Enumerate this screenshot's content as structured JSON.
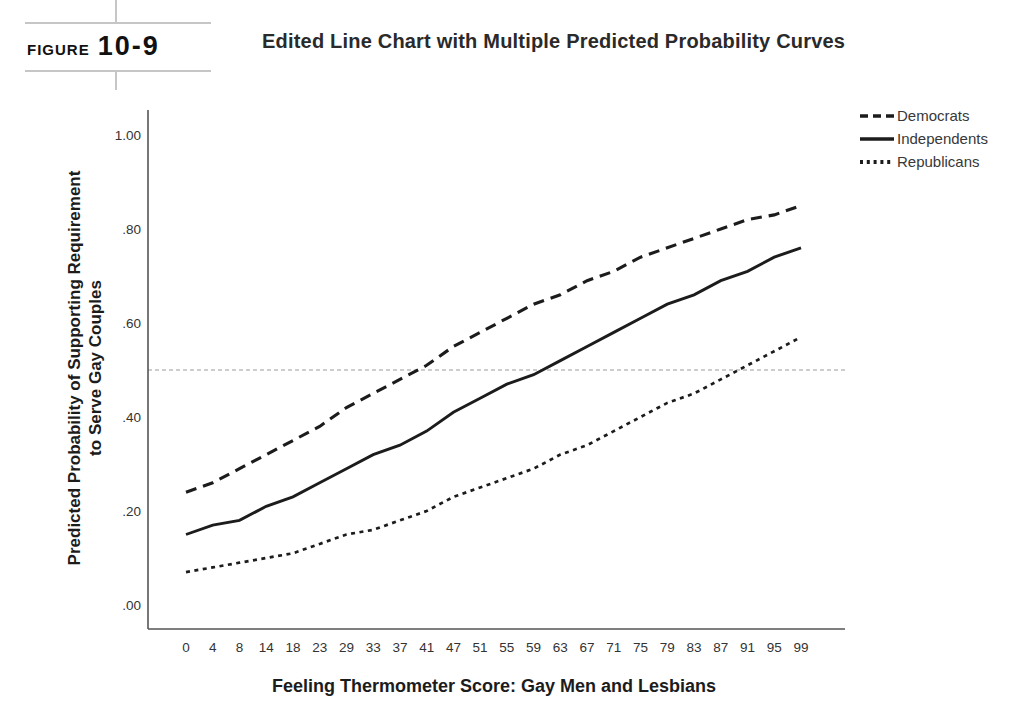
{
  "figure": {
    "label_word": "FIGURE",
    "label_number": "10-9",
    "title": "Edited Line Chart with Multiple Predicted Probability Curves"
  },
  "chart_data": {
    "type": "line",
    "title": "",
    "xlabel": "Feeling Thermometer Score: Gay Men and Lesbians",
    "ylabel_line1": "Predicted Probability of Supporting Requirement",
    "ylabel_line2": "to Serve Gay Couples",
    "x": [
      0,
      4,
      8,
      14,
      18,
      23,
      29,
      33,
      37,
      41,
      47,
      51,
      55,
      59,
      63,
      67,
      71,
      75,
      79,
      83,
      87,
      91,
      95,
      99
    ],
    "series": [
      {
        "name": "Democrats",
        "dash": "long-dash",
        "values": [
          0.24,
          0.26,
          0.29,
          0.32,
          0.35,
          0.38,
          0.42,
          0.45,
          0.48,
          0.51,
          0.55,
          0.58,
          0.61,
          0.64,
          0.66,
          0.69,
          0.71,
          0.74,
          0.76,
          0.78,
          0.8,
          0.82,
          0.83,
          0.85
        ]
      },
      {
        "name": "Independents",
        "dash": "solid",
        "values": [
          0.15,
          0.17,
          0.18,
          0.21,
          0.23,
          0.26,
          0.29,
          0.32,
          0.34,
          0.37,
          0.41,
          0.44,
          0.47,
          0.49,
          0.52,
          0.55,
          0.58,
          0.61,
          0.64,
          0.66,
          0.69,
          0.71,
          0.74,
          0.76
        ]
      },
      {
        "name": "Republicans",
        "dash": "dot",
        "values": [
          0.07,
          0.08,
          0.09,
          0.1,
          0.11,
          0.13,
          0.15,
          0.16,
          0.18,
          0.2,
          0.23,
          0.25,
          0.27,
          0.29,
          0.32,
          0.34,
          0.37,
          0.4,
          0.43,
          0.45,
          0.48,
          0.51,
          0.54,
          0.57
        ]
      }
    ],
    "yticks": [
      ".00",
      ".20",
      ".40",
      ".60",
      ".80",
      "1.00"
    ],
    "ylim": [
      0,
      1
    ],
    "reference_line": 0.5,
    "legend_position": "top-right",
    "grid": false,
    "line_color": "#1c1c1c",
    "axis_color": "#555555",
    "tick_label_color": "#333333",
    "reference_color": "#bdbdbd"
  }
}
